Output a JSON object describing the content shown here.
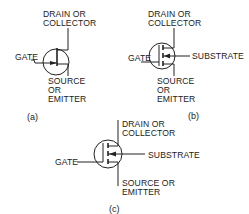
{
  "diagram": {
    "figures": [
      {
        "id": "a",
        "caption": "(a)",
        "labels": {
          "drain_line1": "DRAIN OR",
          "drain_line2": "COLLECTOR",
          "gate": "GATE",
          "source_line1": "SOURCE",
          "source_line2": "OR",
          "source_line3": "EMITTER"
        }
      },
      {
        "id": "b",
        "caption": "(b)",
        "labels": {
          "drain_line1": "DRAIN OR",
          "drain_line2": "COLLECTOR",
          "gate": "GATE",
          "substrate": "SUBSTRATE",
          "source_line1": "SOURCE",
          "source_line2": "OR",
          "source_line3": "EMITTER"
        }
      },
      {
        "id": "c",
        "caption": "(c)",
        "labels": {
          "drain_line1": "DRAIN OR",
          "drain_line2": "COLLECTOR",
          "gate": "GATE",
          "substrate": "SUBSTRATE",
          "source_line1": "SOURCE OR",
          "source_line2": "EMITTER"
        }
      }
    ]
  }
}
